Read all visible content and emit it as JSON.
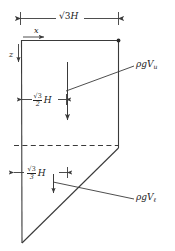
{
  "figure": {
    "name": "pressure-prism-diagram",
    "background_color": "#ffffff",
    "line_color": "#3a3a3a",
    "text_color": "#222222"
  },
  "axes": {
    "x_label": "x",
    "z_label": "z"
  },
  "dimensions": {
    "top_width": {
      "radical": "√3",
      "symbol": "H",
      "text": "√3H"
    },
    "upper_offset": {
      "numerator": "√3",
      "denominator": "2",
      "symbol": "H",
      "text": "(√3/2)H"
    },
    "lower_offset": {
      "numerator": "√3",
      "denominator": "3",
      "symbol": "H",
      "text": "(√3/3)H"
    }
  },
  "forces": [
    {
      "name": "upper-force",
      "rho": "ρ",
      "g": "g",
      "V": "V",
      "subscript": "u",
      "text": "ρgVᵤ"
    },
    {
      "name": "lower-force",
      "rho": "ρ",
      "g": "g",
      "V": "V",
      "subscript": "ℓ",
      "text": "ρgVₗ"
    }
  ],
  "shape": {
    "type": "rectangle-over-triangle",
    "rect_top_y": 40,
    "rect_left_x": 21,
    "rect_right_x": 118,
    "divider_y": 146,
    "apex_x": 22,
    "apex_y": 243
  }
}
